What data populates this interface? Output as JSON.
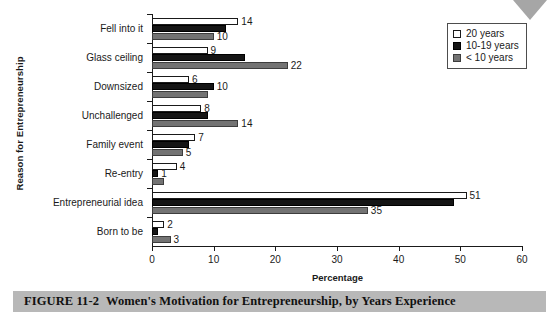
{
  "figure": {
    "caption_number": "FIGURE 11-2",
    "caption_text": "Women's Motivation for Entrepreneurship, by Years Experience"
  },
  "chart_data": {
    "type": "bar",
    "orientation": "horizontal",
    "title": "",
    "xlabel": "Percentage",
    "ylabel": "Reason for Entrepreneurship",
    "xlim": [
      0,
      60
    ],
    "xticks": [
      0,
      10,
      20,
      30,
      40,
      50,
      60
    ],
    "xtick_labels": [
      "0",
      "10",
      "20",
      "30",
      "40",
      "50",
      "60"
    ],
    "grid": false,
    "legend_position": "top-right",
    "categories": [
      "Fell into it",
      "Glass ceiling",
      "Downsized",
      "Unchallenged",
      "Family event",
      "Re-entry",
      "Entrepreneurial idea",
      "Born to be"
    ],
    "series": [
      {
        "name": "20 years",
        "color": "#ffffff",
        "values": [
          14,
          9,
          6,
          8,
          7,
          4,
          51,
          2
        ],
        "labels": [
          "14",
          "9",
          "6",
          "8",
          "7",
          "4",
          "51",
          "2"
        ]
      },
      {
        "name": "10-19 years",
        "color": "#151515",
        "values": [
          12,
          15,
          10,
          9,
          6,
          1,
          49,
          1
        ],
        "labels": [
          "",
          "",
          "10",
          "",
          "",
          "1",
          "",
          ""
        ]
      },
      {
        "name": "< 10 years",
        "color": "#737373",
        "values": [
          10,
          22,
          9,
          14,
          5,
          2,
          35,
          3
        ],
        "labels": [
          "10",
          "22",
          "",
          "14",
          "5",
          "",
          "35",
          "3"
        ]
      }
    ]
  }
}
